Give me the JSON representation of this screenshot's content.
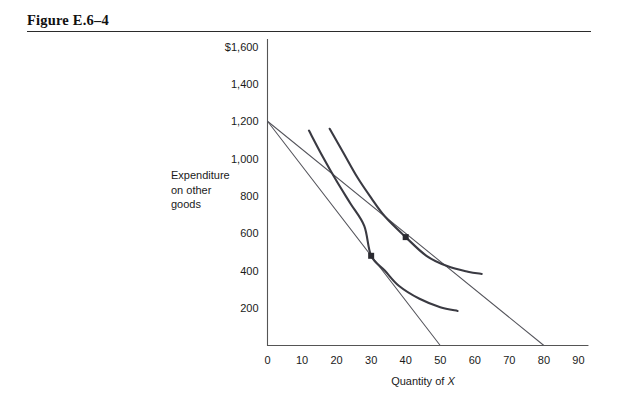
{
  "figure": {
    "title": "Figure E.6–4"
  },
  "chart_data": {
    "type": "line",
    "title": "Figure E.6–4",
    "xlabel_prefix": "Quantity of ",
    "xlabel_symbol": "X",
    "ylabel_lines": [
      "Expenditure",
      "on other",
      "goods"
    ],
    "x_ticks": [
      "0",
      "10",
      "20",
      "30",
      "40",
      "50",
      "60",
      "70",
      "80",
      "90"
    ],
    "x_tick_values": [
      0,
      10,
      20,
      30,
      40,
      50,
      60,
      70,
      80,
      90
    ],
    "y_ticks": [
      "200",
      "400",
      "600",
      "800",
      "1,000",
      "1,200",
      "1,400",
      "$1,600"
    ],
    "y_tick_values": [
      200,
      400,
      600,
      800,
      1000,
      1200,
      1400,
      1600
    ],
    "xlim": [
      0,
      90
    ],
    "ylim": [
      0,
      1600
    ],
    "grid": false,
    "legend": "none",
    "series": [
      {
        "name": "budget-line-steep",
        "type": "line",
        "points": [
          [
            0,
            1200
          ],
          [
            50,
            0
          ]
        ]
      },
      {
        "name": "budget-line-flat",
        "type": "line",
        "points": [
          [
            0,
            1200
          ],
          [
            80,
            0
          ]
        ]
      },
      {
        "name": "indifference-curve-lower",
        "type": "curve",
        "points": [
          [
            12,
            1150
          ],
          [
            16,
            1010
          ],
          [
            20,
            880
          ],
          [
            24,
            760
          ],
          [
            28,
            640
          ],
          [
            30,
            480
          ],
          [
            34,
            400
          ],
          [
            38,
            320
          ],
          [
            44,
            250
          ],
          [
            50,
            205
          ],
          [
            55,
            185
          ]
        ]
      },
      {
        "name": "indifference-curve-upper",
        "type": "curve",
        "points": [
          [
            18,
            1160
          ],
          [
            22,
            1030
          ],
          [
            26,
            900
          ],
          [
            30,
            790
          ],
          [
            34,
            690
          ],
          [
            40,
            580
          ],
          [
            46,
            480
          ],
          [
            52,
            425
          ],
          [
            58,
            395
          ],
          [
            62,
            383
          ]
        ]
      }
    ],
    "annotations": [
      {
        "name": "tangency-point-lower",
        "x": 30,
        "y": 480,
        "marker": "square"
      },
      {
        "name": "tangency-point-upper",
        "x": 40,
        "y": 580,
        "marker": "square"
      }
    ]
  }
}
